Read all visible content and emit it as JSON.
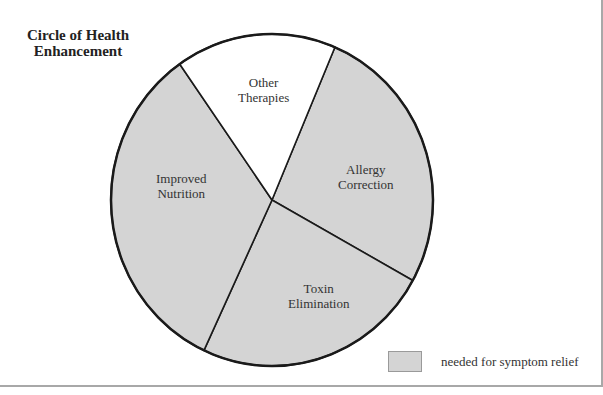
{
  "chart_data": {
    "type": "pie",
    "title": "Circle of Health Enhancement",
    "title_lines": [
      "Circle of Health",
      "Enhancement"
    ],
    "slices": [
      {
        "label": "Allergy Correction",
        "label_lines": [
          "Allergy",
          "Correction"
        ],
        "value": 26.7,
        "start_deg": 23,
        "end_deg": 119,
        "fill": "#d4d4d4",
        "category": "needed for symptom relief"
      },
      {
        "label": "Toxin Elimination",
        "label_lines": [
          "Toxin",
          "Elimination"
        ],
        "value": 23.9,
        "start_deg": 119,
        "end_deg": 205,
        "fill": "#d4d4d4",
        "category": "needed for symptom relief"
      },
      {
        "label": "Improved Nutrition",
        "label_lines": [
          "Improved",
          "Nutrition"
        ],
        "value": 33.3,
        "start_deg": 205,
        "end_deg": 325,
        "fill": "#d4d4d4",
        "category": "needed for symptom relief"
      },
      {
        "label": "Other Therapies",
        "label_lines": [
          "Other",
          "Therapies"
        ],
        "value": 16.1,
        "start_deg": 325,
        "end_deg": 383,
        "fill": "#ffffff",
        "category": ""
      }
    ],
    "legend": [
      {
        "label": "needed for symptom relief",
        "fill": "#d4d4d4"
      }
    ],
    "legend_position": "bottom-right",
    "colors": {
      "shaded": "#d4d4d4",
      "unshaded": "#ffffff",
      "outline": "#1a1a1a"
    }
  }
}
